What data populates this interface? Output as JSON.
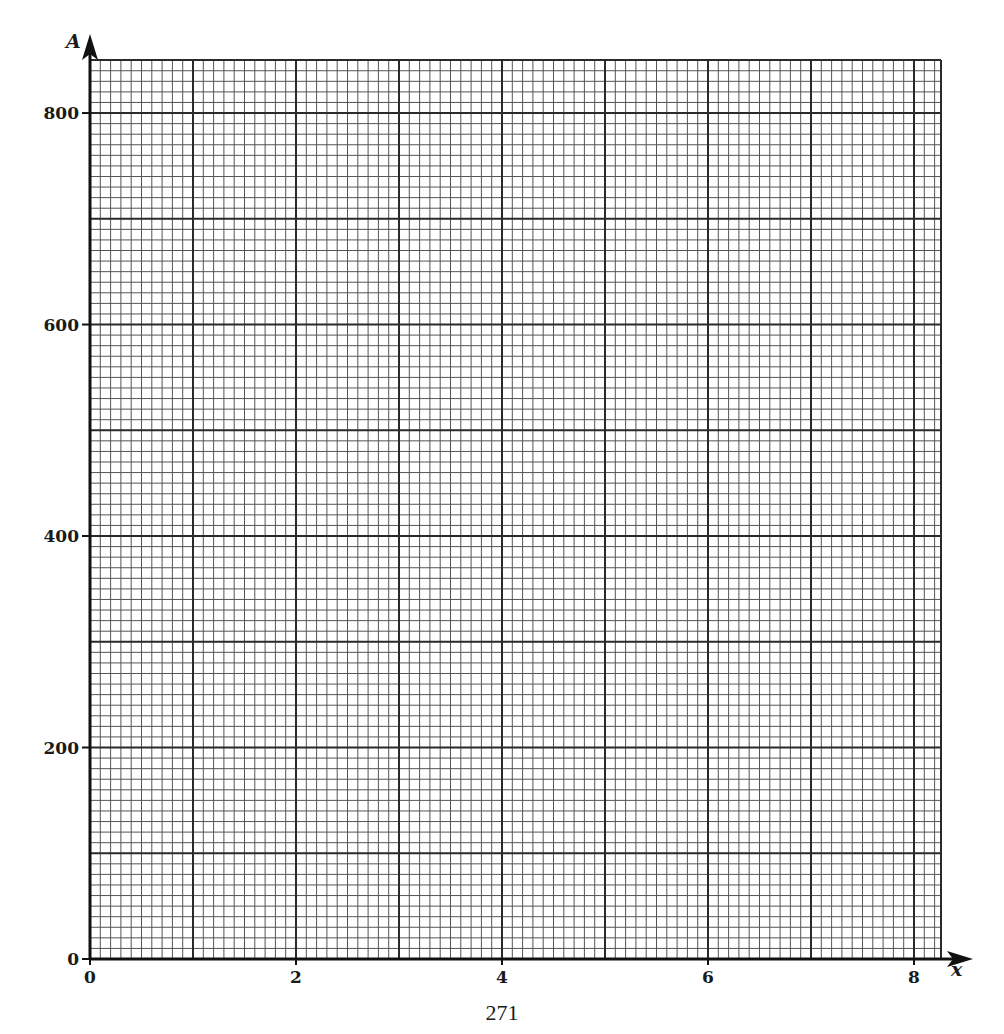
{
  "chart_data": {
    "type": "line",
    "title": "",
    "xlabel": "x",
    "ylabel": "A",
    "xlim": [
      0,
      8.26
    ],
    "ylim": [
      0,
      850
    ],
    "x_ticks": [
      0,
      2,
      4,
      6,
      8
    ],
    "x_tick_labels": [
      "0",
      "2",
      "4",
      "6",
      "8"
    ],
    "y_ticks": [
      0,
      200,
      400,
      600,
      800
    ],
    "y_tick_labels": [
      "0",
      "200",
      "400",
      "600",
      "800"
    ],
    "grid": true,
    "grid_major": {
      "x_step": 1,
      "y_step": 100
    },
    "grid_minor": {
      "x_step": 0.1,
      "y_step": 10
    },
    "series": [],
    "legend": null,
    "note": "Blank graph paper grid with axes, no plotted data"
  },
  "layout": {
    "origin_px": [
      90,
      959
    ],
    "px_per_x_unit": 103.0,
    "px_per_y_unit": 1.05745,
    "grid_right_px": 941,
    "grid_top_px": 60,
    "colors": {
      "axis": "#111111",
      "major": "#2a2a2a",
      "minor": "#555555",
      "text": "#1a1a1a"
    }
  },
  "page": {
    "page_number": "271"
  }
}
